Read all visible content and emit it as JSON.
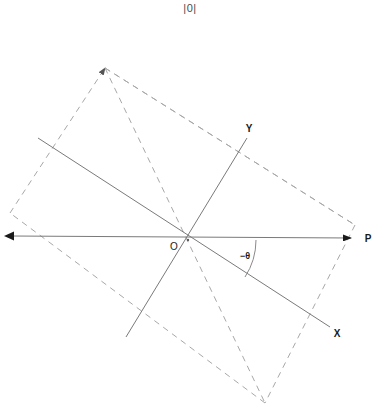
{
  "figure": {
    "title": "|0|",
    "width": 380,
    "height": 412,
    "background_color": "#ffffff"
  },
  "colors": {
    "solid_line": "#7a7a7a",
    "dashed_line": "#a8a8a8",
    "arrowhead": "#1a1a1a",
    "label_text": "#1a1a1a",
    "title_text": "#4c4c4c"
  },
  "labels": {
    "origin": "O",
    "x_axis": "X",
    "y_axis": "Y",
    "reference_point": "P",
    "angle": "−θ"
  },
  "geometry": {
    "origin": {
      "x": 188,
      "y": 240
    },
    "reference_axis": {
      "name": "horizontal-reference-axis",
      "from": {
        "x": 8,
        "y": 236
      },
      "to": {
        "x": 355,
        "y": 238
      },
      "arrow_start": true,
      "arrow_end": true,
      "label": "P",
      "label_pos": {
        "x": 365,
        "y": 242
      }
    },
    "x_axis": {
      "name": "rotated-x-axis",
      "from": {
        "x": 38,
        "y": 138
      },
      "to": {
        "x": 330,
        "y": 327
      },
      "label": "X",
      "label_pos": {
        "x": 335,
        "y": 337
      }
    },
    "y_axis": {
      "name": "rotated-y-axis",
      "from": {
        "x": 126,
        "y": 337
      },
      "to": {
        "x": 247,
        "y": 138
      },
      "label": "Y",
      "label_pos": {
        "x": 246,
        "y": 132
      }
    },
    "angle_arc": {
      "name": "negative-theta-arc",
      "center": {
        "x": 188,
        "y": 240
      },
      "radius": 68,
      "from_angle_deg": 0,
      "to_angle_deg": 33,
      "label": "−θ",
      "label_pos": {
        "x": 236,
        "y": 259
      }
    },
    "dashed_quad": {
      "name": "dashed-rotated-rectangle",
      "vertices": [
        {
          "x": 105,
          "y": 68
        },
        {
          "x": 355,
          "y": 225
        },
        {
          "x": 265,
          "y": 403
        },
        {
          "x": 10,
          "y": 213
        }
      ],
      "arrow_at_vertex": 0
    },
    "dashed_diagonals": [
      {
        "name": "diagonal-top-to-bottom",
        "from": {
          "x": 105,
          "y": 68
        },
        "to": {
          "x": 265,
          "y": 403
        }
      },
      {
        "name": "diagonal-top-to-right",
        "from": {
          "x": 105,
          "y": 68
        },
        "to": {
          "x": 355,
          "y": 225
        }
      }
    ]
  }
}
